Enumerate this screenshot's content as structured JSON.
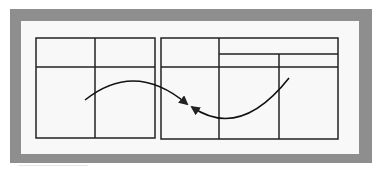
{
  "diagram": {
    "title": "",
    "colors": {
      "frame": "#8e8e8e",
      "panel": "#f8f8f8",
      "lines": "#222222"
    },
    "tables": [
      {
        "name": "left-table",
        "x": 36,
        "y": 38,
        "width": 119,
        "height": 100,
        "header_row_y": 67,
        "column_dividers_x": [
          95
        ],
        "subheader": null
      },
      {
        "name": "right-table",
        "x": 161,
        "y": 38,
        "width": 177,
        "height": 101,
        "header_row_y": 67,
        "column_dividers_x": [
          219,
          279
        ],
        "subheader": {
          "line_y": 54,
          "from_x": 219,
          "to_x": 338
        }
      }
    ],
    "arrows": [
      {
        "name": "left-to-center-arrow",
        "from": [
          85,
          100
        ],
        "control": [
          135,
          60
        ],
        "to": [
          187,
          104
        ]
      },
      {
        "name": "right-to-center-arrow",
        "from": [
          289,
          78
        ],
        "control": [
          240,
          140
        ],
        "to": [
          192,
          107
        ]
      }
    ]
  }
}
